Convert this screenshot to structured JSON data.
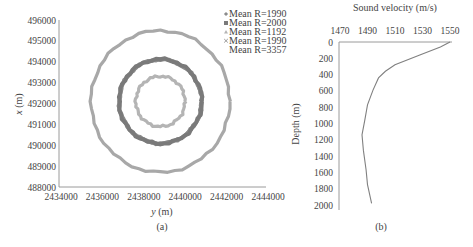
{
  "chart_data": [
    {
      "type": "scatter",
      "panel": "(a)",
      "title": "",
      "xlabel": "y (m)",
      "ylabel": "x (m)",
      "xlim": [
        2434000,
        2444000
      ],
      "ylim": [
        488000,
        496000
      ],
      "x_ticks": [
        "2434000",
        "2436000",
        "2438000",
        "2440000",
        "2442000",
        "2444000"
      ],
      "y_ticks": [
        "496000",
        "495000",
        "494000",
        "493000",
        "492000",
        "491000",
        "490000",
        "489000",
        "488000"
      ],
      "grid": false,
      "legend_position": "top-right",
      "center": {
        "y": 2438900,
        "x": 492100
      },
      "series": [
        {
          "name": "Mean R=1990",
          "marker": "diamond",
          "color": "#8c8c8c",
          "radius_m": 1990
        },
        {
          "name": "Mean R=2000",
          "marker": "square",
          "color": "#7a7a7a",
          "radius_m": 2000
        },
        {
          "name": "Mean R=1192",
          "marker": "triangle",
          "color": "#b4b4b4",
          "radius_m": 1192
        },
        {
          "name": "Mean R=1990",
          "marker": "x",
          "color": "#8c8c8c",
          "radius_m": 1990
        },
        {
          "name": "Mean R=3357",
          "marker": "none",
          "color": "#a8a8a8",
          "radius_m": 3357
        }
      ]
    },
    {
      "type": "line",
      "panel": "(b)",
      "title": "Sound velocity (m/s)",
      "xlabel": "Sound velocity (m/s)",
      "ylabel": "Depth (m)",
      "xlim": [
        1470,
        1550
      ],
      "ylim": [
        2000,
        0
      ],
      "x_ticks": [
        "1470",
        "1490",
        "1510",
        "1530",
        "1550"
      ],
      "y_ticks": [
        "0",
        "200",
        "400",
        "600",
        "800",
        "1000",
        "1200",
        "1400",
        "1600",
        "1800",
        "2000"
      ],
      "grid": false,
      "series": [
        {
          "name": "Sound velocity profile",
          "color": "#808080",
          "velocity": [
            1550,
            1543,
            1528,
            1510,
            1503,
            1498,
            1494,
            1490,
            1488,
            1486,
            1487,
            1489,
            1490,
            1493
          ],
          "depth": [
            0,
            60,
            160,
            280,
            360,
            440,
            590,
            770,
            960,
            1140,
            1330,
            1570,
            1750,
            1980
          ]
        }
      ]
    }
  ],
  "labels": {
    "panel_a": {
      "xlabel_var": "y",
      "xlabel_unit": "(m)",
      "ylabel_var": "x",
      "ylabel_unit": "(m)",
      "caption": "(a)"
    },
    "panel_b": {
      "title": "Sound velocity (m/s)",
      "ylabel": "Depth (m)",
      "caption": "(b)"
    }
  }
}
